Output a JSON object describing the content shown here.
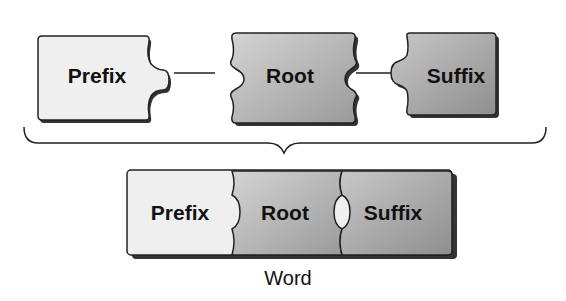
{
  "diagram": {
    "top_row": [
      {
        "label": "Prefix",
        "fill": "#f2f2f2"
      },
      {
        "label": "Root",
        "fill": "#bdbdbd"
      },
      {
        "label": "Suffix",
        "fill": "#a8a8a8"
      }
    ],
    "combined_row": [
      {
        "label": "Prefix"
      },
      {
        "label": "Root"
      },
      {
        "label": "Suffix"
      }
    ],
    "caption": "Word"
  }
}
